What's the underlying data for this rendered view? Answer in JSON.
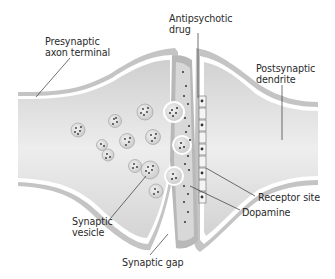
{
  "diagram": {
    "type": "anatomical-illustration",
    "colors": {
      "background": "#ffffff",
      "membrane_outer": "#c8c8c8",
      "membrane_inner": "#ffffff",
      "cytoplasm": "#dcdcdc",
      "cytoplasm_light": "#ececec",
      "vesicle_fill": "#e8e8e8",
      "vesicle_dot": "#3a3a3a",
      "leader_line": "#333333",
      "text": "#2a2a2a"
    },
    "labels": [
      {
        "id": "presynaptic",
        "text": "Presynaptic\naxon terminal",
        "x": 45,
        "y": 36
      },
      {
        "id": "antipsychotic",
        "text": "Antipsychotic\ndrug",
        "x": 169,
        "y": 13
      },
      {
        "id": "postsynaptic",
        "text": "Postsynaptic\ndendrite",
        "x": 256,
        "y": 63
      },
      {
        "id": "receptor",
        "text": "Receptor site",
        "x": 258,
        "y": 192
      },
      {
        "id": "dopamine",
        "text": "Dopamine",
        "x": 242,
        "y": 207
      },
      {
        "id": "vesicle",
        "text": "Synaptic\nvesicle",
        "x": 72,
        "y": 216
      },
      {
        "id": "gap",
        "text": "Synaptic gap",
        "x": 122,
        "y": 257
      }
    ]
  }
}
